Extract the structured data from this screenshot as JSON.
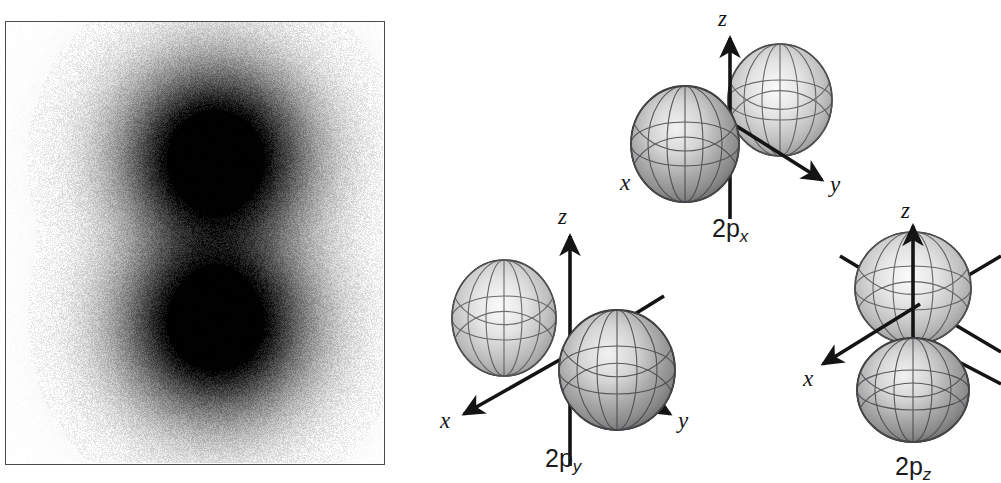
{
  "figure": {
    "background_color": "#ffffff",
    "ink_color": "#141414"
  },
  "density_panel": {
    "name": "electron-density-plot",
    "description": "Grayscale electron probability density cross-section of a 2p orbital showing two dark lobes separated by a nodal plane",
    "border_color": "#4a4a4a",
    "fill_color": "#ffffff",
    "lobe_color": "#000000",
    "node_orientation": "horizontal",
    "lobe_count": 2
  },
  "orbitals": [
    {
      "id": "2px",
      "label_text": "2p",
      "label_sub": "x",
      "axes": [
        {
          "name": "z",
          "letter": "z"
        },
        {
          "name": "y",
          "letter": "y"
        },
        {
          "name": "x",
          "letter": "x"
        }
      ],
      "lobe_axis": "x",
      "lobe_count": 2
    },
    {
      "id": "2py",
      "label_text": "2p",
      "label_sub": "y",
      "axes": [
        {
          "name": "z",
          "letter": "z"
        },
        {
          "name": "y",
          "letter": "y"
        },
        {
          "name": "x",
          "letter": "x"
        }
      ],
      "lobe_axis": "y",
      "lobe_count": 2
    },
    {
      "id": "2pz",
      "label_text": "2p",
      "label_sub": "z",
      "axes": [
        {
          "name": "z",
          "letter": "z"
        },
        {
          "name": "x",
          "letter": "x"
        }
      ],
      "lobe_axis": "z",
      "lobe_count": 2
    }
  ],
  "chart_data": {
    "type": "heatmap",
    "title": "",
    "xlabel": "",
    "ylabel": "",
    "legend_position": "none",
    "grid": false,
    "colormap": "grayscale-inverted",
    "lobes": [
      {
        "center_x": 0.0,
        "center_y": 0.62,
        "peak_intensity": 1.0
      },
      {
        "center_x": 0.0,
        "center_y": -0.62,
        "peak_intensity": 1.0
      }
    ]
  }
}
